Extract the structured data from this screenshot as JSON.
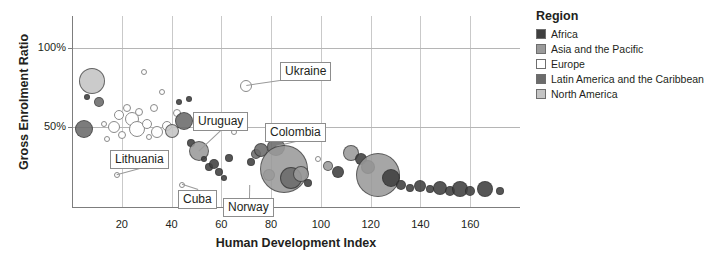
{
  "chart_data": {
    "type": "scatter",
    "title": "",
    "xlabel": "Human Development Index",
    "ylabel": "Gross Enrolment Ratio",
    "xlim": [
      0,
      180
    ],
    "ylim": [
      0,
      120
    ],
    "xticks": [
      20,
      40,
      60,
      80,
      100,
      120,
      140,
      160
    ],
    "xticklabels": [
      "20",
      "40",
      "60",
      "80",
      "100",
      "120",
      "140",
      "160"
    ],
    "yticks": [
      50,
      100
    ],
    "yticklabels": [
      "50%",
      "100%"
    ],
    "grid": "both",
    "legend_position": "right",
    "legend_title": "Region",
    "series": [
      {
        "name": "Africa",
        "color": "#3f3f3f"
      },
      {
        "name": "Asia and the Pacific",
        "color": "#9a9a9a"
      },
      {
        "name": "Europe",
        "color": "#ffffff"
      },
      {
        "name": "Latin America and the Caribbean",
        "color": "#6b6b6b"
      },
      {
        "name": "North America",
        "color": "#c4c4c4"
      }
    ],
    "annotations": [
      {
        "label": "Ukraine",
        "x": 70,
        "y": 76
      },
      {
        "label": "Uruguay",
        "x": 51,
        "y": 35
      },
      {
        "label": "Colombia",
        "x": 82,
        "y": 38
      },
      {
        "label": "Lithuania",
        "x": 18,
        "y": 20
      },
      {
        "label": "Cuba",
        "x": 44,
        "y": 14
      },
      {
        "label": "Norway",
        "x": 71,
        "y": 14
      }
    ],
    "points": [
      {
        "x": 5,
        "y": 49,
        "r": 9,
        "region": "Latin America and the Caribbean"
      },
      {
        "x": 8,
        "y": 79,
        "r": 13,
        "region": "North America"
      },
      {
        "x": 6,
        "y": 69,
        "r": 3,
        "region": "Africa"
      },
      {
        "x": 11,
        "y": 66,
        "r": 5,
        "region": "Latin America and the Caribbean"
      },
      {
        "x": 13,
        "y": 52,
        "r": 3,
        "region": "Europe"
      },
      {
        "x": 17,
        "y": 50,
        "r": 6,
        "region": "Europe"
      },
      {
        "x": 19,
        "y": 58,
        "r": 5,
        "region": "Europe"
      },
      {
        "x": 20,
        "y": 45,
        "r": 4,
        "region": "Europe"
      },
      {
        "x": 22,
        "y": 62,
        "r": 4,
        "region": "Europe"
      },
      {
        "x": 24,
        "y": 55,
        "r": 7,
        "region": "Europe"
      },
      {
        "x": 26,
        "y": 49,
        "r": 8,
        "region": "Europe"
      },
      {
        "x": 27,
        "y": 60,
        "r": 4,
        "region": "Europe"
      },
      {
        "x": 29,
        "y": 85,
        "r": 3,
        "region": "Europe"
      },
      {
        "x": 30,
        "y": 52,
        "r": 5,
        "region": "Europe"
      },
      {
        "x": 31,
        "y": 44,
        "r": 3,
        "region": "Europe"
      },
      {
        "x": 33,
        "y": 62,
        "r": 4,
        "region": "Europe"
      },
      {
        "x": 34,
        "y": 47,
        "r": 6,
        "region": "Europe"
      },
      {
        "x": 18,
        "y": 20,
        "r": 3,
        "region": "Europe"
      },
      {
        "x": 14,
        "y": 43,
        "r": 3,
        "region": "Europe"
      },
      {
        "x": 36,
        "y": 72,
        "r": 3,
        "region": "Europe"
      },
      {
        "x": 38,
        "y": 51,
        "r": 5,
        "region": "Europe"
      },
      {
        "x": 40,
        "y": 48,
        "r": 7,
        "region": "North America"
      },
      {
        "x": 42,
        "y": 59,
        "r": 4,
        "region": "Europe"
      },
      {
        "x": 43,
        "y": 66,
        "r": 3,
        "region": "Africa"
      },
      {
        "x": 45,
        "y": 54,
        "r": 9,
        "region": "Latin America and the Caribbean"
      },
      {
        "x": 47,
        "y": 68,
        "r": 3,
        "region": "Africa"
      },
      {
        "x": 48,
        "y": 40,
        "r": 4,
        "region": "Africa"
      },
      {
        "x": 51,
        "y": 35,
        "r": 10,
        "region": "Asia and the Pacific"
      },
      {
        "x": 53,
        "y": 30,
        "r": 3,
        "region": "Africa"
      },
      {
        "x": 55,
        "y": 25,
        "r": 4,
        "region": "Africa"
      },
      {
        "x": 57,
        "y": 27,
        "r": 5,
        "region": "Africa"
      },
      {
        "x": 44,
        "y": 14,
        "r": 3,
        "region": "Europe"
      },
      {
        "x": 59,
        "y": 22,
        "r": 4,
        "region": "Africa"
      },
      {
        "x": 61,
        "y": 18,
        "r": 3,
        "region": "Africa"
      },
      {
        "x": 63,
        "y": 31,
        "r": 4,
        "region": "Africa"
      },
      {
        "x": 65,
        "y": 47,
        "r": 3,
        "region": "Europe"
      },
      {
        "x": 67,
        "y": 56,
        "r": 4,
        "region": "Europe"
      },
      {
        "x": 70,
        "y": 76,
        "r": 6,
        "region": "Europe"
      },
      {
        "x": 72,
        "y": 28,
        "r": 4,
        "region": "Africa"
      },
      {
        "x": 74,
        "y": 33,
        "r": 5,
        "region": "Latin America and the Caribbean"
      },
      {
        "x": 76,
        "y": 36,
        "r": 7,
        "region": "Latin America and the Caribbean"
      },
      {
        "x": 79,
        "y": 20,
        "r": 6,
        "region": "Asia and the Pacific"
      },
      {
        "x": 82,
        "y": 38,
        "r": 9,
        "region": "Latin America and the Caribbean"
      },
      {
        "x": 85,
        "y": 24,
        "r": 24,
        "region": "Asia and the Pacific"
      },
      {
        "x": 88,
        "y": 18,
        "r": 11,
        "region": "Latin America and the Caribbean"
      },
      {
        "x": 92,
        "y": 21,
        "r": 8,
        "region": "Asia and the Pacific"
      },
      {
        "x": 95,
        "y": 15,
        "r": 4,
        "region": "Africa"
      },
      {
        "x": 99,
        "y": 30,
        "r": 3,
        "region": "Europe"
      },
      {
        "x": 103,
        "y": 26,
        "r": 5,
        "region": "Asia and the Pacific"
      },
      {
        "x": 107,
        "y": 22,
        "r": 6,
        "region": "Africa"
      },
      {
        "x": 112,
        "y": 34,
        "r": 8,
        "region": "Asia and the Pacific"
      },
      {
        "x": 116,
        "y": 30,
        "r": 6,
        "region": "Africa"
      },
      {
        "x": 119,
        "y": 25,
        "r": 7,
        "region": "Latin America and the Caribbean"
      },
      {
        "x": 123,
        "y": 20,
        "r": 22,
        "region": "Asia and the Pacific"
      },
      {
        "x": 128,
        "y": 18,
        "r": 9,
        "region": "Africa"
      },
      {
        "x": 132,
        "y": 14,
        "r": 5,
        "region": "Africa"
      },
      {
        "x": 136,
        "y": 12,
        "r": 4,
        "region": "Africa"
      },
      {
        "x": 140,
        "y": 13,
        "r": 6,
        "region": "Africa"
      },
      {
        "x": 144,
        "y": 11,
        "r": 4,
        "region": "Africa"
      },
      {
        "x": 148,
        "y": 12,
        "r": 7,
        "region": "Africa"
      },
      {
        "x": 152,
        "y": 10,
        "r": 5,
        "region": "Africa"
      },
      {
        "x": 156,
        "y": 11,
        "r": 8,
        "region": "Africa"
      },
      {
        "x": 160,
        "y": 10,
        "r": 5,
        "region": "Africa"
      },
      {
        "x": 166,
        "y": 11,
        "r": 8,
        "region": "Africa"
      },
      {
        "x": 172,
        "y": 10,
        "r": 4,
        "region": "Africa"
      }
    ]
  },
  "legend": {
    "title": "Region",
    "items": [
      {
        "label": "Africa",
        "color": "#3f3f3f"
      },
      {
        "label": "Asia and the Pacific",
        "color": "#9a9a9a"
      },
      {
        "label": "Europe",
        "color": "#ffffff"
      },
      {
        "label": "Latin America and the Caribbean",
        "color": "#6b6b6b"
      },
      {
        "label": "North America",
        "color": "#c4c4c4"
      }
    ]
  }
}
